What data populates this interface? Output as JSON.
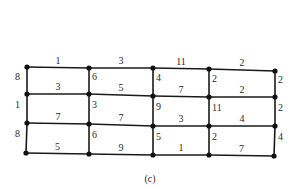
{
  "caption": "(c)",
  "grid": {
    "rows": 4,
    "cols": 5,
    "horizontal_weights": [
      [
        "1",
        "3",
        "11",
        "2"
      ],
      [
        "3",
        "5",
        "7",
        "2"
      ],
      [
        "7",
        "7",
        "3",
        "4"
      ],
      [
        "5",
        "9",
        "1",
        "7"
      ]
    ],
    "vertical_weights": [
      [
        "8",
        "6",
        "4",
        "2",
        "2"
      ],
      [
        "1",
        "3",
        "9",
        "11",
        "2"
      ],
      [
        "8",
        "6",
        "5",
        "2",
        "4"
      ]
    ]
  },
  "colors": {
    "edge": "#1a1a1a",
    "node": "#111111",
    "text": "#2a2a2a"
  }
}
